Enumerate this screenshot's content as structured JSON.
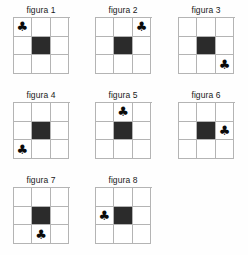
{
  "page": {
    "background_color": "#fefefe",
    "grid_line_color": "#b4b4b4",
    "filled_cell_color": "#2b2b2b",
    "symbol_color": "#0a0a0a",
    "symbol_glyph": "♣",
    "symbol_name": "club-suit-icon",
    "columns": 3,
    "rows": 3
  },
  "figures": [
    {
      "caption": "figura 1",
      "cells": [
        {
          "filled": false,
          "symbol": "♣"
        },
        {
          "filled": false,
          "symbol": ""
        },
        {
          "filled": false,
          "symbol": ""
        },
        {
          "filled": false,
          "symbol": ""
        },
        {
          "filled": true,
          "symbol": ""
        },
        {
          "filled": false,
          "symbol": ""
        },
        {
          "filled": false,
          "symbol": ""
        },
        {
          "filled": false,
          "symbol": ""
        },
        {
          "filled": false,
          "symbol": ""
        }
      ],
      "symbol_position": "top-left",
      "filled_position": "center"
    },
    {
      "caption": "figura 2",
      "cells": [
        {
          "filled": false,
          "symbol": ""
        },
        {
          "filled": false,
          "symbol": ""
        },
        {
          "filled": false,
          "symbol": "♣"
        },
        {
          "filled": false,
          "symbol": ""
        },
        {
          "filled": true,
          "symbol": ""
        },
        {
          "filled": false,
          "symbol": ""
        },
        {
          "filled": false,
          "symbol": ""
        },
        {
          "filled": false,
          "symbol": ""
        },
        {
          "filled": false,
          "symbol": ""
        }
      ],
      "symbol_position": "top-right",
      "filled_position": "center"
    },
    {
      "caption": "figura 3",
      "cells": [
        {
          "filled": false,
          "symbol": ""
        },
        {
          "filled": false,
          "symbol": ""
        },
        {
          "filled": false,
          "symbol": ""
        },
        {
          "filled": false,
          "symbol": ""
        },
        {
          "filled": true,
          "symbol": ""
        },
        {
          "filled": false,
          "symbol": ""
        },
        {
          "filled": false,
          "symbol": ""
        },
        {
          "filled": false,
          "symbol": ""
        },
        {
          "filled": false,
          "symbol": "♣"
        }
      ],
      "symbol_position": "bottom-right",
      "filled_position": "center"
    },
    {
      "caption": "figura 4",
      "cells": [
        {
          "filled": false,
          "symbol": ""
        },
        {
          "filled": false,
          "symbol": ""
        },
        {
          "filled": false,
          "symbol": ""
        },
        {
          "filled": false,
          "symbol": ""
        },
        {
          "filled": true,
          "symbol": ""
        },
        {
          "filled": false,
          "symbol": ""
        },
        {
          "filled": false,
          "symbol": "♣"
        },
        {
          "filled": false,
          "symbol": ""
        },
        {
          "filled": false,
          "symbol": ""
        }
      ],
      "symbol_position": "bottom-left",
      "filled_position": "center"
    },
    {
      "caption": "figura 5",
      "cells": [
        {
          "filled": false,
          "symbol": ""
        },
        {
          "filled": false,
          "symbol": "♣"
        },
        {
          "filled": false,
          "symbol": ""
        },
        {
          "filled": false,
          "symbol": ""
        },
        {
          "filled": true,
          "symbol": ""
        },
        {
          "filled": false,
          "symbol": ""
        },
        {
          "filled": false,
          "symbol": ""
        },
        {
          "filled": false,
          "symbol": ""
        },
        {
          "filled": false,
          "symbol": ""
        }
      ],
      "symbol_position": "top-center",
      "filled_position": "center"
    },
    {
      "caption": "figura 6",
      "cells": [
        {
          "filled": false,
          "symbol": ""
        },
        {
          "filled": false,
          "symbol": ""
        },
        {
          "filled": false,
          "symbol": ""
        },
        {
          "filled": false,
          "symbol": ""
        },
        {
          "filled": true,
          "symbol": ""
        },
        {
          "filled": false,
          "symbol": "♣"
        },
        {
          "filled": false,
          "symbol": ""
        },
        {
          "filled": false,
          "symbol": ""
        },
        {
          "filled": false,
          "symbol": ""
        }
      ],
      "symbol_position": "middle-right",
      "filled_position": "center"
    },
    {
      "caption": "figura 7",
      "cells": [
        {
          "filled": false,
          "symbol": ""
        },
        {
          "filled": false,
          "symbol": ""
        },
        {
          "filled": false,
          "symbol": ""
        },
        {
          "filled": false,
          "symbol": ""
        },
        {
          "filled": true,
          "symbol": ""
        },
        {
          "filled": false,
          "symbol": ""
        },
        {
          "filled": false,
          "symbol": ""
        },
        {
          "filled": false,
          "symbol": "♣"
        },
        {
          "filled": false,
          "symbol": ""
        }
      ],
      "symbol_position": "bottom-center",
      "filled_position": "center"
    },
    {
      "caption": "figura 8",
      "cells": [
        {
          "filled": false,
          "symbol": ""
        },
        {
          "filled": false,
          "symbol": ""
        },
        {
          "filled": false,
          "symbol": ""
        },
        {
          "filled": false,
          "symbol": "♣"
        },
        {
          "filled": true,
          "symbol": ""
        },
        {
          "filled": false,
          "symbol": ""
        },
        {
          "filled": false,
          "symbol": ""
        },
        {
          "filled": false,
          "symbol": ""
        },
        {
          "filled": false,
          "symbol": ""
        }
      ],
      "symbol_position": "middle-left",
      "filled_position": "center"
    }
  ]
}
